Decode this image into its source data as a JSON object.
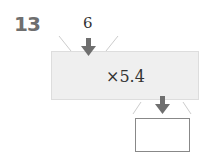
{
  "problem": {
    "number": "13"
  },
  "machine": {
    "input": "6",
    "operation": "×5.4",
    "output": ""
  },
  "colors": {
    "arrow": "#6f6f6f",
    "machine_fill": "#efefef",
    "number": "#6f6f6f"
  }
}
